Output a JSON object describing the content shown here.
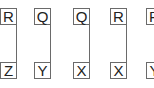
{
  "diagram": {
    "cards": [
      {
        "top": "R",
        "bottom": "Z"
      },
      {
        "top": "Q",
        "bottom": "Y"
      },
      {
        "top": "Q",
        "bottom": "X"
      },
      {
        "top": "R",
        "bottom": "X"
      },
      {
        "top": "R",
        "bottom": "Y"
      }
    ],
    "colors": {
      "border": "#6a6a6a",
      "text": "#222222",
      "background": "#ffffff"
    }
  }
}
